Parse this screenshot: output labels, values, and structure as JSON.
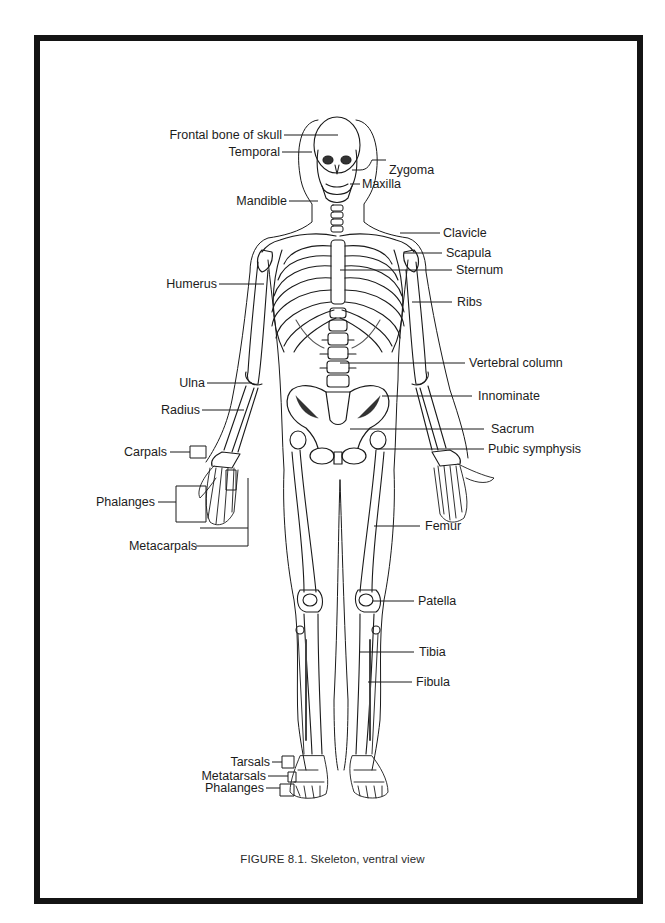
{
  "figure": {
    "caption": "FIGURE 8.1. Skeleton, ventral view",
    "subject": "Skeleton, ventral view"
  },
  "labels_left": [
    {
      "id": "frontal",
      "text": "Frontal bone of skull"
    },
    {
      "id": "temporal",
      "text": "Temporal"
    },
    {
      "id": "mandible",
      "text": "Mandible"
    },
    {
      "id": "humerus",
      "text": "Humerus"
    },
    {
      "id": "ulna",
      "text": "Ulna"
    },
    {
      "id": "radius",
      "text": "Radius"
    },
    {
      "id": "carpals",
      "text": "Carpals"
    },
    {
      "id": "phalanges_hand",
      "text": "Phalanges"
    },
    {
      "id": "metacarpals",
      "text": "Metacarpals"
    },
    {
      "id": "tarsals",
      "text": "Tarsals"
    },
    {
      "id": "metatarsals",
      "text": "Metatarsals"
    },
    {
      "id": "phalanges_foot",
      "text": "Phalanges"
    }
  ],
  "labels_right": [
    {
      "id": "zygoma",
      "text": "Zygoma"
    },
    {
      "id": "maxilla",
      "text": "Maxilla"
    },
    {
      "id": "clavicle",
      "text": "Clavicle"
    },
    {
      "id": "scapula",
      "text": "Scapula"
    },
    {
      "id": "sternum",
      "text": "Sternum"
    },
    {
      "id": "ribs",
      "text": "Ribs"
    },
    {
      "id": "vertebral",
      "text": "Vertebral column"
    },
    {
      "id": "innominate",
      "text": "Innominate"
    },
    {
      "id": "sacrum",
      "text": "Sacrum"
    },
    {
      "id": "pubic",
      "text": "Pubic symphysis"
    },
    {
      "id": "femur",
      "text": "Femur"
    },
    {
      "id": "patella",
      "text": "Patella"
    },
    {
      "id": "tibia",
      "text": "Tibia"
    },
    {
      "id": "fibula",
      "text": "Fibula"
    }
  ],
  "colors": {
    "ink": "#1a1a1a",
    "frame": "#141414",
    "background": "#ffffff",
    "bone_shade": "#3a3a3a"
  }
}
